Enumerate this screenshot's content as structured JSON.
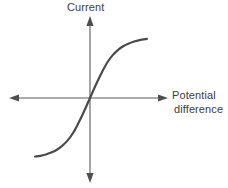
{
  "figure": {
    "kind": "iv-characteristic-graph",
    "background_color": "#ffffff",
    "axis_color": "#5a5a5a",
    "curve_color": "#4a4a4a",
    "label_color": "#3d3d3d"
  },
  "labels": {
    "y_axis": "Current",
    "x_axis_line_1": "Potential",
    "x_axis_line_2": "difference"
  },
  "chart_data": {
    "type": "line",
    "title": "",
    "xlabel": "Potential difference",
    "ylabel": "Current",
    "grid": false,
    "legend_position": "none",
    "axis_style": "four-way-arrows-through-origin",
    "origin_px": [
      90,
      98
    ],
    "xlim": [
      -1.0,
      1.0
    ],
    "ylim": [
      -1.0,
      1.0
    ],
    "x_tick_labels": [],
    "y_tick_labels": [],
    "annotations": [],
    "series": [
      {
        "name": "Current vs potential difference",
        "shape": "sigmoid",
        "symmetry": "odd-symmetric-about-origin",
        "color": "#4a4a4a",
        "line_width_px": 2.2,
        "x": [
          -0.82,
          -0.74,
          -0.66,
          -0.58,
          -0.5,
          -0.42,
          -0.34,
          -0.26,
          -0.18,
          -0.1,
          -0.03,
          0.0,
          0.03,
          0.1,
          0.18,
          0.26,
          0.34,
          0.42,
          0.5,
          0.58,
          0.66,
          0.74,
          0.85
        ],
        "y": [
          -0.9,
          -0.89,
          -0.87,
          -0.84,
          -0.8,
          -0.74,
          -0.66,
          -0.55,
          -0.4,
          -0.23,
          -0.07,
          0.0,
          0.07,
          0.23,
          0.4,
          0.55,
          0.66,
          0.74,
          0.8,
          0.84,
          0.87,
          0.89,
          0.91
        ],
        "endpoint_px_start": [
          25,
          165
        ],
        "endpoint_px_end": [
          157,
          33
        ]
      }
    ]
  }
}
